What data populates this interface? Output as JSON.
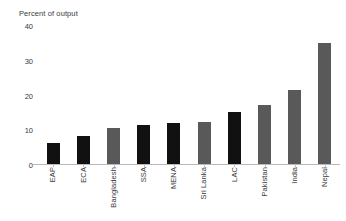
{
  "chart_data": {
    "type": "bar",
    "title": "Percent of output",
    "xlabel": "",
    "ylabel": "",
    "ylim": [
      0,
      40
    ],
    "yticks": [
      0,
      10,
      20,
      30,
      40
    ],
    "grid": false,
    "legend": "none",
    "categories": [
      "EAP",
      "ECA",
      "Bangladesh",
      "SSA",
      "MENA",
      "Sri Lanka",
      "LAC",
      "Pakistan",
      "India",
      "Nepal"
    ],
    "values": [
      6.2,
      8.0,
      10.5,
      11.2,
      12.0,
      12.3,
      15.2,
      17.2,
      21.4,
      35.0
    ],
    "colors": [
      "#111111",
      "#111111",
      "#595959",
      "#111111",
      "#111111",
      "#595959",
      "#111111",
      "#595959",
      "#595959",
      "#595959"
    ],
    "bar_colors_meaning": {
      "region": "#111111",
      "country": "#595959"
    },
    "axis_color": "#b9b9b9",
    "text_color": "#3a3a3a"
  }
}
